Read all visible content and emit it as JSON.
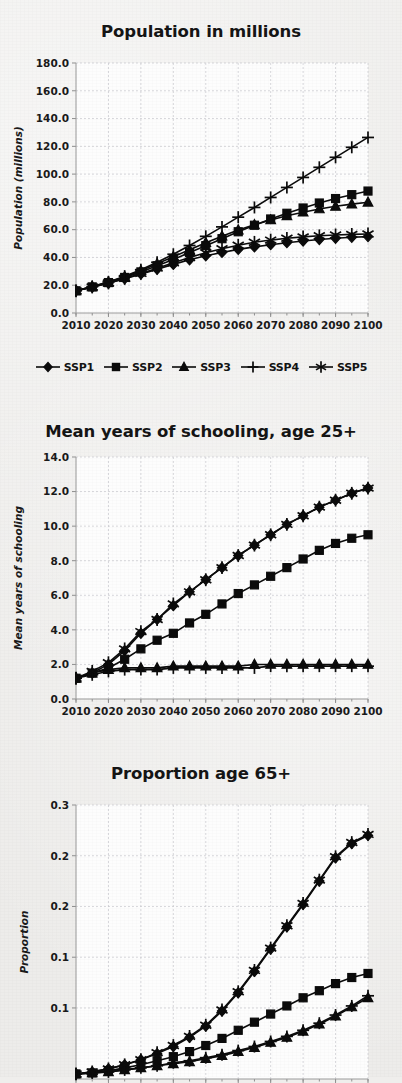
{
  "page": {
    "background_color": "#edecea",
    "ink_color": "#0b0b0b",
    "grid_color": "#c9c9cf",
    "axis_color": "#9a9a9a"
  },
  "legend": {
    "position": "below-chart-1",
    "items": [
      {
        "label": "SSP1",
        "marker": "diamond",
        "icon": "diamond-marker-icon"
      },
      {
        "label": "SSP2",
        "marker": "square",
        "icon": "square-marker-icon"
      },
      {
        "label": "SSP3",
        "marker": "triangle",
        "icon": "triangle-marker-icon"
      },
      {
        "label": "SSP4",
        "marker": "plus",
        "icon": "plus-marker-icon"
      },
      {
        "label": "SSP5",
        "marker": "asterisk",
        "icon": "asterisk-marker-icon"
      }
    ]
  },
  "charts": [
    {
      "id": "population",
      "title": "Population in millions",
      "ylabel": "Population (millions)",
      "xlabel": ""
    },
    {
      "id": "schooling",
      "title": "Mean years of schooling, age 25+",
      "ylabel": "Mean years of schooling",
      "xlabel": ""
    },
    {
      "id": "proportion65",
      "title": "Proportion age 65+",
      "ylabel": "Proportion",
      "xlabel": ""
    }
  ],
  "chart_data": [
    {
      "type": "line",
      "id": "population",
      "title": "Population in millions",
      "xlabel": "",
      "ylabel": "Population (millions)",
      "xtick_labels": [
        "2010",
        "2020",
        "2030",
        "2040",
        "2050",
        "2060",
        "2070",
        "2080",
        "2090",
        "2100"
      ],
      "ytick_labels": [
        "0.0",
        "20.0",
        "40.0",
        "60.0",
        "80.0",
        "100.0",
        "120.0",
        "140.0",
        "160.0",
        "180.0"
      ],
      "xlim": [
        2010,
        2100
      ],
      "ylim": [
        0,
        180
      ],
      "grid": true,
      "legend_position": "bottom",
      "x": [
        2010,
        2015,
        2020,
        2025,
        2030,
        2035,
        2040,
        2045,
        2050,
        2055,
        2060,
        2065,
        2070,
        2075,
        2080,
        2085,
        2090,
        2095,
        2100
      ],
      "series": [
        {
          "name": "SSP1",
          "marker": "diamond",
          "values": [
            16.0,
            18.6,
            21.4,
            24.6,
            28.0,
            31.5,
            35.0,
            38.3,
            41.2,
            43.6,
            45.8,
            47.6,
            49.2,
            50.6,
            51.8,
            52.9,
            53.8,
            54.5,
            55.0
          ]
        },
        {
          "name": "SSP2",
          "marker": "square",
          "values": [
            16.0,
            18.8,
            21.9,
            25.6,
            29.6,
            34.0,
            38.6,
            43.5,
            48.5,
            53.5,
            58.5,
            63.2,
            67.7,
            71.8,
            75.6,
            79.2,
            82.4,
            85.2,
            87.8
          ]
        },
        {
          "name": "SSP3",
          "marker": "triangle",
          "values": [
            16.0,
            18.9,
            22.2,
            26.1,
            30.5,
            35.4,
            40.5,
            45.6,
            50.6,
            55.3,
            59.7,
            63.5,
            67.0,
            70.0,
            72.6,
            74.9,
            76.8,
            78.4,
            79.7
          ]
        },
        {
          "name": "SSP4",
          "marker": "plus",
          "values": [
            16.0,
            19.0,
            22.4,
            26.5,
            31.2,
            36.5,
            42.3,
            48.6,
            55.2,
            62.0,
            69.0,
            76.0,
            83.2,
            90.4,
            97.6,
            104.9,
            112.1,
            119.3,
            126.4
          ]
        },
        {
          "name": "SSP5",
          "marker": "asterisk",
          "values": [
            16.0,
            18.7,
            21.6,
            24.9,
            28.5,
            32.3,
            36.2,
            40.0,
            43.4,
            46.3,
            48.8,
            50.9,
            52.5,
            53.8,
            54.8,
            55.6,
            56.2,
            56.6,
            56.9
          ]
        }
      ],
      "note_visible_curves": "Three distinct envelopes are visible: an upper pair (SSP4/SSP5 overlapping) rising to ~160, a middle square series (SSP2) rising to ~99, and a lower series flattening near ~57."
    },
    {
      "type": "line",
      "id": "schooling",
      "title": "Mean years of schooling, age 25+",
      "xlabel": "",
      "ylabel": "Mean years of schooling",
      "xtick_labels": [
        "2010",
        "2020",
        "2030",
        "2040",
        "2050",
        "2060",
        "2070",
        "2080",
        "2090",
        "2100"
      ],
      "ytick_labels": [
        "0.0",
        "2.0",
        "4.0",
        "6.0",
        "8.0",
        "10.0",
        "12.0",
        "14.0"
      ],
      "xlim": [
        2010,
        2100
      ],
      "ylim": [
        0,
        14
      ],
      "grid": true,
      "legend_position": "none",
      "x": [
        2010,
        2015,
        2020,
        2025,
        2030,
        2035,
        2040,
        2045,
        2050,
        2055,
        2060,
        2065,
        2070,
        2075,
        2080,
        2085,
        2090,
        2095,
        2100
      ],
      "series": [
        {
          "name": "SSP1",
          "marker": "diamond",
          "values": [
            1.2,
            1.5,
            2.0,
            2.8,
            3.8,
            4.6,
            5.4,
            6.2,
            6.9,
            7.6,
            8.3,
            8.9,
            9.5,
            10.1,
            10.6,
            11.1,
            11.5,
            11.9,
            12.2
          ]
        },
        {
          "name": "SSP2",
          "marker": "square",
          "values": [
            1.2,
            1.5,
            1.8,
            2.3,
            2.9,
            3.4,
            3.8,
            4.4,
            4.9,
            5.5,
            6.1,
            6.6,
            7.1,
            7.6,
            8.1,
            8.6,
            9.0,
            9.3,
            9.5
          ]
        },
        {
          "name": "SSP3",
          "marker": "triangle",
          "values": [
            1.2,
            1.5,
            1.7,
            1.8,
            1.8,
            1.8,
            1.9,
            1.9,
            1.9,
            1.9,
            1.9,
            2.0,
            2.0,
            2.0,
            2.0,
            2.0,
            2.0,
            2.0,
            2.0
          ]
        },
        {
          "name": "SSP4",
          "marker": "plus",
          "values": [
            1.2,
            1.4,
            1.6,
            1.7,
            1.7,
            1.7,
            1.8,
            1.8,
            1.8,
            1.8,
            1.8,
            1.8,
            1.9,
            1.9,
            1.9,
            1.9,
            1.9,
            1.9,
            1.9
          ]
        },
        {
          "name": "SSP5",
          "marker": "asterisk",
          "values": [
            1.2,
            1.6,
            2.1,
            2.9,
            3.9,
            4.6,
            5.5,
            6.2,
            6.9,
            7.6,
            8.3,
            8.9,
            9.5,
            10.1,
            10.6,
            11.1,
            11.5,
            11.9,
            12.2
          ]
        }
      ],
      "note_visible_curves": "Top curve (SSP1/SSP5 overlapping) rises to ~12.2; square series (SSP2) rises to ~9.5; SSP3 and SSP4 stay flat near 1.8-2.0."
    },
    {
      "type": "line",
      "id": "proportion65",
      "title": "Proportion age 65+",
      "xlabel": "",
      "ylabel": "Proportion",
      "xtick_labels": [
        "2010",
        "2020",
        "2030",
        "2040",
        "2050",
        "2060",
        "2070",
        "2080",
        "2090",
        "2100"
      ],
      "ytick_labels": [
        "0.1",
        "0.1",
        "0.2",
        "0.2",
        "0.3"
      ],
      "ytick_values": [
        0.1,
        0.15,
        0.2,
        0.25,
        0.3
      ],
      "xlim": [
        2010,
        2100
      ],
      "ylim": [
        0.03,
        0.3
      ],
      "grid": true,
      "legend_position": "none",
      "cropped": "bottom edge of plot is cut off by the image boundary",
      "x": [
        2010,
        2015,
        2020,
        2025,
        2030,
        2035,
        2040,
        2045,
        2050,
        2055,
        2060,
        2065,
        2070,
        2075,
        2080,
        2085,
        2090,
        2095,
        2100
      ],
      "series": [
        {
          "name": "SSP1",
          "marker": "diamond",
          "values": [
            0.035,
            0.037,
            0.04,
            0.044,
            0.049,
            0.055,
            0.062,
            0.071,
            0.082,
            0.097,
            0.115,
            0.136,
            0.158,
            0.18,
            0.202,
            0.225,
            0.248,
            0.262,
            0.27
          ]
        },
        {
          "name": "SSP2",
          "marker": "square",
          "values": [
            0.035,
            0.036,
            0.038,
            0.041,
            0.044,
            0.048,
            0.052,
            0.057,
            0.063,
            0.07,
            0.078,
            0.086,
            0.094,
            0.102,
            0.11,
            0.117,
            0.124,
            0.13,
            0.134
          ]
        },
        {
          "name": "SSP3",
          "marker": "triangle",
          "values": [
            0.035,
            0.036,
            0.037,
            0.039,
            0.041,
            0.043,
            0.045,
            0.047,
            0.05,
            0.053,
            0.057,
            0.061,
            0.066,
            0.071,
            0.077,
            0.084,
            0.092,
            0.101,
            0.11
          ]
        },
        {
          "name": "SSP4",
          "marker": "plus",
          "values": [
            0.035,
            0.036,
            0.037,
            0.039,
            0.041,
            0.043,
            0.046,
            0.048,
            0.051,
            0.054,
            0.058,
            0.062,
            0.067,
            0.072,
            0.078,
            0.085,
            0.093,
            0.102,
            0.112
          ]
        },
        {
          "name": "SSP5",
          "marker": "asterisk",
          "values": [
            0.035,
            0.037,
            0.04,
            0.044,
            0.049,
            0.056,
            0.063,
            0.072,
            0.083,
            0.098,
            0.116,
            0.137,
            0.159,
            0.181,
            0.203,
            0.226,
            0.249,
            0.263,
            0.271
          ]
        }
      ],
      "note_visible_curves": "Steep upper curve (SSP1/SSP5 overlapping) reaching ~0.27 by 2100; square series (SSP2) reaching ~0.134; lower pair (SSP3/SSP4) reaching ~0.11."
    }
  ]
}
